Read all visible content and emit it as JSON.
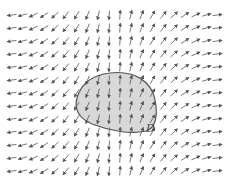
{
  "figure": {
    "region_label": "D",
    "colors": {
      "background": "#ffffff",
      "arrow": "#555555",
      "region_fill": "#d8d8d8",
      "region_stroke": "#555555",
      "label": "#444444"
    },
    "grid": {
      "columns": 20,
      "rows": 13,
      "x_start": 12,
      "x_step": 10.8,
      "y_start": 15,
      "y_step": 13,
      "arrow_length": 9
    },
    "field_behavior": "Left half arrows point down-left (nearly horizontal at far left, vertical down near center); right half arrows point up-right (vertical up near center, nearly horizontal at far right)",
    "region": {
      "path": "M 110 73 C 135 70 152 82 155 100 C 158 115 156 128 146 131 C 130 135 108 130 92 124 C 78 118 74 108 77 98 C 81 84 92 75 110 73 Z",
      "label_position": {
        "x": 146,
        "y": 122
      }
    }
  }
}
